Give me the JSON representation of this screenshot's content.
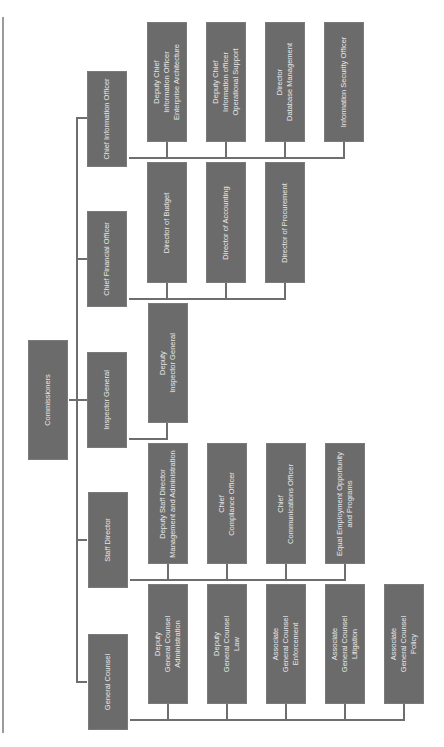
{
  "chart": {
    "orientation": "rotated-90",
    "colors": {
      "box_fill": "#6b6b6b",
      "box_text": "#e8e8e8",
      "connector": "#6e6e6e",
      "page_border": "#9a9a9a"
    },
    "root": {
      "label": [
        "Commissioners"
      ]
    },
    "branches": [
      {
        "label": [
          "Chief Information Officer"
        ],
        "children": [
          {
            "label": [
              "Deputy Chief",
              "Information Officer",
              "Enterprise Architecture"
            ]
          },
          {
            "label": [
              "Deputy Chief",
              "Information officer",
              "Operational Support"
            ]
          },
          {
            "label": [
              "Director",
              "Database Management"
            ]
          },
          {
            "label": [
              "Information Security Officer"
            ]
          }
        ]
      },
      {
        "label": [
          "Chief Financial Officer"
        ],
        "children": [
          {
            "label": [
              "Director of Budget"
            ]
          },
          {
            "label": [
              "Director of Accounting"
            ]
          },
          {
            "label": [
              "Director of Procurement"
            ]
          }
        ]
      },
      {
        "label": [
          "Inspector General"
        ],
        "children": [
          {
            "label": [
              "Deputy",
              "Inspector General"
            ]
          }
        ]
      },
      {
        "label": [
          "Staff Director"
        ],
        "children": [
          {
            "label": [
              "Deputy Staff Director",
              "Management and Administration"
            ]
          },
          {
            "label": [
              "Chief",
              "Compliance Officer"
            ]
          },
          {
            "label": [
              "Chief",
              "Communications Officer"
            ]
          },
          {
            "label": [
              "Equal Employment Opportunity",
              "and Programs"
            ]
          }
        ]
      },
      {
        "label": [
          "General Counsel"
        ],
        "children": [
          {
            "label": [
              "Deputy",
              "General Counsel",
              "Administration"
            ]
          },
          {
            "label": [
              "Deputy",
              "General Counsel",
              "Law"
            ]
          },
          {
            "label": [
              "Associate",
              "General Counsel",
              "Enforcement"
            ]
          },
          {
            "label": [
              "Associate",
              "General Counsel",
              "Litigation"
            ]
          },
          {
            "label": [
              "Associate",
              "General Counsel",
              "Policy"
            ]
          }
        ]
      }
    ]
  }
}
